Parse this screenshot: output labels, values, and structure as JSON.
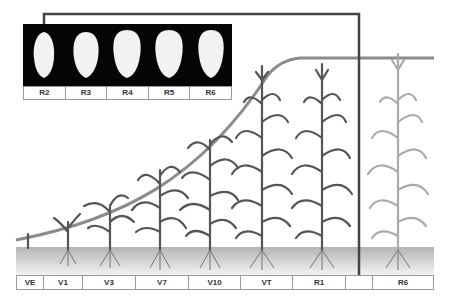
{
  "kernel_stages": [
    "R2",
    "R3",
    "R4",
    "R5",
    "R6"
  ],
  "growth_stages": [
    {
      "label": "VE",
      "x": 0,
      "w": 27
    },
    {
      "label": "V1",
      "x": 27,
      "w": 39
    },
    {
      "label": "V3",
      "x": 66,
      "w": 53
    },
    {
      "label": "V7",
      "x": 119,
      "w": 53
    },
    {
      "label": "V10",
      "x": 172,
      "w": 52
    },
    {
      "label": "VT",
      "x": 224,
      "w": 52
    },
    {
      "label": "R1",
      "x": 276,
      "w": 53
    },
    {
      "label": "",
      "x": 329,
      "w": 27
    },
    {
      "label": "R6",
      "x": 356,
      "w": 62
    }
  ],
  "colors": {
    "plant": "#555555",
    "plant_faded": "#aaaaaa",
    "soil": "#bbbbbb",
    "curve": "#888888",
    "connector": "#444444"
  }
}
